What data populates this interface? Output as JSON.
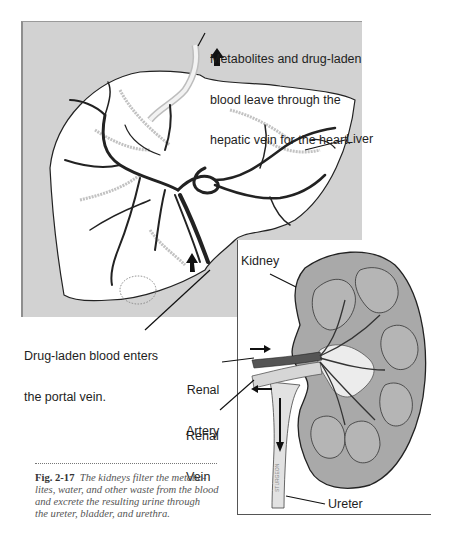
{
  "figure": {
    "number": "Fig. 2-17",
    "caption": "The kidneys filter the metabolites, water, and other waste from the blood and excrete the resulting urine through the ureter, bladder, and urethra.",
    "caption_lines": [
      "The kidneys filter the metabo-",
      "lites, water, and other waste from the blood",
      "and excrete the resulting urine through",
      "the ureter, bladder, and urethra."
    ]
  },
  "liver_panel": {
    "labels": {
      "hepatic_vein": [
        "Metabolites and drug-laden",
        "blood leave through the",
        "hepatic vein for the heart."
      ],
      "liver": "Liver",
      "portal_vein": [
        "Drug-laden blood enters",
        "the portal vein."
      ]
    },
    "colors": {
      "panel_bg": "#d2d2d2",
      "organ_fill": "#ffffff",
      "vessel": "#2a2a2a"
    }
  },
  "kidney_panel": {
    "labels": {
      "kidney": "Kidney",
      "renal_artery": [
        "Renal",
        "Artery"
      ],
      "renal_vein": [
        "Renal",
        "Vein"
      ],
      "ureter": "Ureter",
      "artist_signature": "STURGEON"
    },
    "colors": {
      "kidney_fill": "#a9a9a9",
      "artery": "#555555",
      "vein": "#d6d6d6"
    }
  }
}
